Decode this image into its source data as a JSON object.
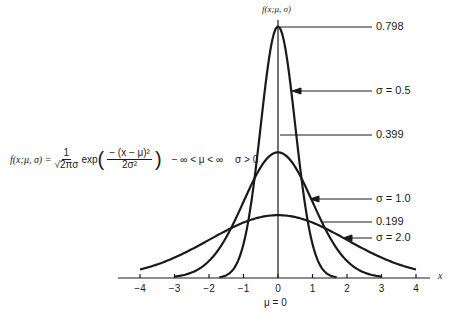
{
  "chart_data": {
    "type": "line",
    "title": "",
    "xlabel": "x",
    "ylabel": "f(x;μ, σ)",
    "x_ticks": [
      "−4",
      "−3",
      "−2",
      "−1",
      "0",
      "1",
      "2",
      "3",
      "4"
    ],
    "xlim": [
      -4,
      4
    ],
    "grid": false,
    "series": [
      {
        "name": "σ = 0.5",
        "mu": 0,
        "sigma": 0.5,
        "peak": 0.798,
        "x_range": [
          -1.7,
          1.7
        ]
      },
      {
        "name": "σ = 1.0",
        "mu": 0,
        "sigma": 1.0,
        "peak": 0.399,
        "x_range": [
          -3,
          3
        ]
      },
      {
        "name": "σ = 2.0",
        "mu": 0,
        "sigma": 2.0,
        "peak": 0.199,
        "x_range": [
          -4,
          4
        ]
      }
    ],
    "annotations": {
      "peak_labels": [
        "0.798",
        "0.399",
        "0.199"
      ],
      "curve_labels": [
        "σ = 0.5",
        "σ = 1.0",
        "σ = 2.0"
      ],
      "mean_label": "μ = 0"
    }
  },
  "labels": {
    "y_axis": "f(x;μ, σ)",
    "x_axis": "x",
    "mu": "μ = 0",
    "peak_798": "0.798",
    "peak_399": "0.399",
    "peak_199": "0.199",
    "sigma_05": "σ = 0.5",
    "sigma_10": "σ = 1.0",
    "sigma_20": "σ = 2.0"
  },
  "formula": {
    "lhs": "f(x;μ, σ) =",
    "frac_num": "1",
    "frac_den": "√2πσ",
    "exp": "exp",
    "exp_num": "− (x − μ)²",
    "exp_den": "2σ²",
    "domain_mu": "− ∞ < μ < ∞",
    "domain_sigma": "σ > 0"
  },
  "ticks": [
    "−4",
    "−3",
    "−2",
    "−1",
    "0",
    "1",
    "2",
    "3",
    "4"
  ]
}
